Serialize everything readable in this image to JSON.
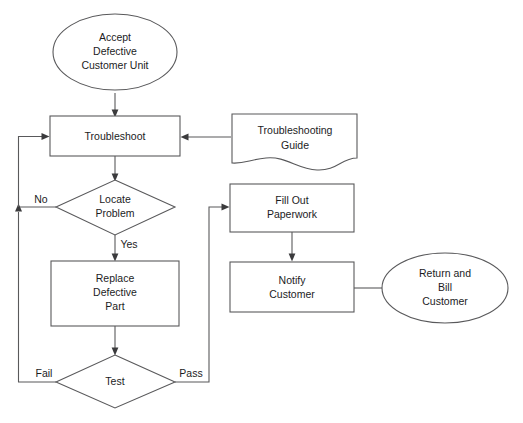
{
  "diagram": {
    "background_color": "#ffffff",
    "stroke_color": "#59595b",
    "text_color": "#1c1c1e",
    "nodes": {
      "accept_unit": {
        "shape": "ellipse",
        "lines": [
          "Accept",
          "Defective",
          "Customer Unit"
        ]
      },
      "troubleshoot": {
        "shape": "process",
        "lines": [
          "Troubleshoot"
        ]
      },
      "troubleshooting_guide": {
        "shape": "document",
        "lines": [
          "Troubleshooting",
          "Guide"
        ]
      },
      "locate_problem": {
        "shape": "decision",
        "lines": [
          "Locate",
          "Problem"
        ]
      },
      "replace_part": {
        "shape": "process",
        "lines": [
          "Replace",
          "Defective",
          "Part"
        ]
      },
      "test": {
        "shape": "decision",
        "lines": [
          "Test"
        ]
      },
      "fill_out_paperwork": {
        "shape": "process",
        "lines": [
          "Fill Out",
          "Paperwork"
        ]
      },
      "notify_customer": {
        "shape": "process",
        "lines": [
          "Notify",
          "Customer"
        ]
      },
      "return_bill_customer": {
        "shape": "ellipse",
        "lines": [
          "Return and",
          "Bill",
          "Customer"
        ]
      }
    },
    "edge_labels": {
      "locate_problem_no": "No",
      "locate_problem_yes": "Yes",
      "test_fail": "Fail",
      "test_pass": "Pass"
    }
  }
}
